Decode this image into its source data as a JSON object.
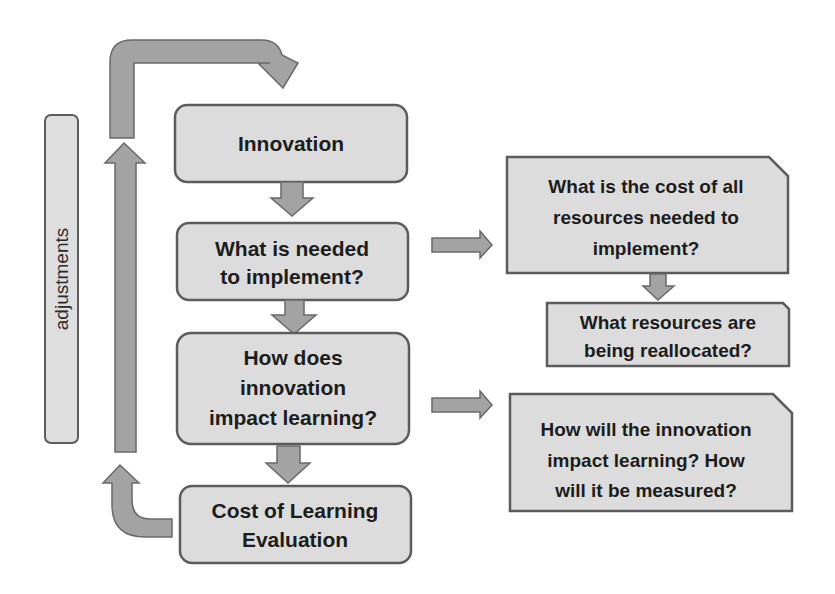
{
  "diagram": {
    "sidebar_label": "adjustments",
    "flow_boxes": [
      {
        "id": "innovation",
        "lines": [
          "Innovation"
        ]
      },
      {
        "id": "needed",
        "lines": [
          "What is needed",
          "to implement?"
        ]
      },
      {
        "id": "impact",
        "lines": [
          "How does",
          "innovation",
          "impact learning?"
        ]
      },
      {
        "id": "cost-eval",
        "lines": [
          "Cost of Learning",
          "Evaluation"
        ]
      }
    ],
    "side_boxes": [
      {
        "id": "cost-resources",
        "lines": [
          "What is the cost of all",
          "resources needed to",
          "implement?"
        ]
      },
      {
        "id": "reallocated",
        "lines": [
          "What resources are",
          "being reallocated?"
        ]
      },
      {
        "id": "measure",
        "lines": [
          "How will the innovation",
          "impact learning? How",
          "will it be measured?"
        ]
      }
    ],
    "connections": [
      {
        "from": "innovation",
        "to": "needed"
      },
      {
        "from": "needed",
        "to": "impact"
      },
      {
        "from": "impact",
        "to": "cost-eval"
      },
      {
        "from": "needed",
        "to": "cost-resources"
      },
      {
        "from": "cost-resources",
        "to": "reallocated"
      },
      {
        "from": "impact",
        "to": "measure"
      },
      {
        "from": "cost-eval",
        "to": "innovation",
        "label": "adjustments"
      }
    ],
    "colors": {
      "box_fill": "#dcdcdc",
      "box_stroke": "#5c5c5c",
      "arrow_fill": "#a3a3a3",
      "text": "#1c1c1c"
    }
  }
}
